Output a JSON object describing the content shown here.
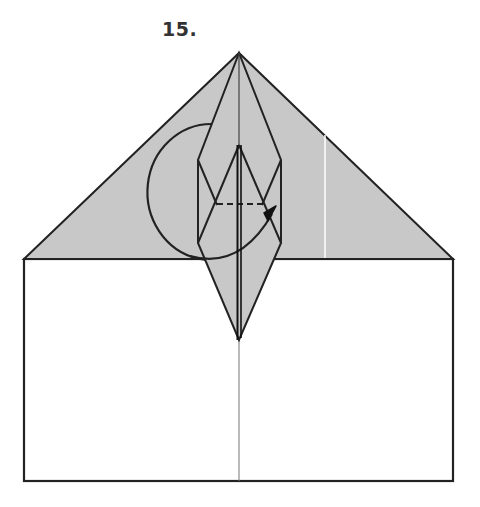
{
  "step": {
    "label": "15."
  },
  "colors": {
    "paper_shaded": "#c8c8c8",
    "paper_white": "#ffffff",
    "line": "#222222",
    "crease": "#777777",
    "crease_light": "#ffffff"
  },
  "diagram": {
    "symbols": [
      "circular-arrow",
      "valley-fold-dashed-line",
      "center-crease"
    ]
  }
}
